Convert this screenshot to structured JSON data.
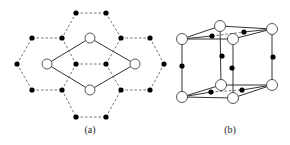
{
  "figure": {
    "panel_a": {
      "label": "(a)",
      "description": "Hexagonal lattice (top view) with rhombic unit cell",
      "open_atoms": [
        [
          90,
          38
        ],
        [
          47,
          64
        ],
        [
          135,
          64
        ],
        [
          90,
          90
        ]
      ],
      "filled_atoms": [
        [
          76,
          13
        ],
        [
          106,
          13
        ],
        [
          32,
          38
        ],
        [
          62,
          38
        ],
        [
          121,
          38
        ],
        [
          150,
          38
        ],
        [
          17,
          64
        ],
        [
          76,
          64
        ],
        [
          106,
          64
        ],
        [
          164,
          64
        ],
        [
          32,
          90
        ],
        [
          62,
          90
        ],
        [
          121,
          90
        ],
        [
          150,
          90
        ],
        [
          76,
          117
        ],
        [
          106,
          117
        ]
      ],
      "dashed_bonds": [
        [
          [
            76,
            13
          ],
          [
            106,
            13
          ]
        ],
        [
          [
            76,
            13
          ],
          [
            62,
            38
          ]
        ],
        [
          [
            106,
            13
          ],
          [
            121,
            38
          ]
        ],
        [
          [
            32,
            38
          ],
          [
            62,
            38
          ]
        ],
        [
          [
            121,
            38
          ],
          [
            150,
            38
          ]
        ],
        [
          [
            17,
            64
          ],
          [
            32,
            38
          ]
        ],
        [
          [
            17,
            64
          ],
          [
            32,
            90
          ]
        ],
        [
          [
            62,
            38
          ],
          [
            76,
            64
          ]
        ],
        [
          [
            76,
            64
          ],
          [
            106,
            64
          ]
        ],
        [
          [
            106,
            64
          ],
          [
            121,
            38
          ]
        ],
        [
          [
            150,
            38
          ],
          [
            164,
            64
          ]
        ],
        [
          [
            164,
            64
          ],
          [
            150,
            90
          ]
        ],
        [
          [
            76,
            64
          ],
          [
            62,
            90
          ]
        ],
        [
          [
            106,
            64
          ],
          [
            121,
            90
          ]
        ],
        [
          [
            32,
            90
          ],
          [
            62,
            90
          ]
        ],
        [
          [
            121,
            90
          ],
          [
            150,
            90
          ]
        ],
        [
          [
            62,
            90
          ],
          [
            76,
            117
          ]
        ],
        [
          [
            76,
            117
          ],
          [
            106,
            117
          ]
        ],
        [
          [
            106,
            117
          ],
          [
            121,
            90
          ]
        ]
      ],
      "solid_bonds": [
        [
          [
            47,
            64
          ],
          [
            90,
            38
          ]
        ],
        [
          [
            90,
            38
          ],
          [
            135,
            64
          ]
        ],
        [
          [
            135,
            64
          ],
          [
            90,
            90
          ]
        ],
        [
          [
            90,
            90
          ],
          [
            47,
            64
          ]
        ]
      ]
    },
    "panel_b": {
      "label": "(b)",
      "description": "3D hexagonal prism unit cell",
      "open_atoms": [
        [
          182,
          39
        ],
        [
          220,
          26
        ],
        [
          272,
          29
        ],
        [
          233,
          39
        ],
        [
          182,
          97
        ],
        [
          221,
          85
        ],
        [
          272,
          85
        ],
        [
          233,
          98
        ]
      ],
      "filled_atoms": [
        [
          212,
          36
        ],
        [
          244,
          32
        ],
        [
          211,
          92
        ],
        [
          242,
          90
        ],
        [
          182,
          66
        ],
        [
          222,
          56
        ],
        [
          232,
          68
        ],
        [
          273,
          57
        ]
      ],
      "solid_bonds": [
        [
          [
            182,
            39
          ],
          [
            220,
            26
          ]
        ],
        [
          [
            220,
            26
          ],
          [
            272,
            29
          ]
        ],
        [
          [
            182,
            39
          ],
          [
            233,
            39
          ]
        ],
        [
          [
            233,
            39
          ],
          [
            272,
            29
          ]
        ],
        [
          [
            182,
            39
          ],
          [
            212,
            36
          ]
        ],
        [
          [
            244,
            32
          ],
          [
            272,
            29
          ]
        ],
        [
          [
            182,
            97
          ],
          [
            221,
            85
          ]
        ],
        [
          [
            221,
            85
          ],
          [
            272,
            85
          ]
        ],
        [
          [
            182,
            97
          ],
          [
            233,
            98
          ]
        ],
        [
          [
            233,
            98
          ],
          [
            272,
            85
          ]
        ],
        [
          [
            182,
            97
          ],
          [
            211,
            92
          ]
        ],
        [
          [
            242,
            90
          ],
          [
            272,
            85
          ]
        ],
        [
          [
            182,
            39
          ],
          [
            182,
            97
          ]
        ],
        [
          [
            220,
            26
          ],
          [
            221,
            85
          ]
        ],
        [
          [
            233,
            39
          ],
          [
            233,
            98
          ]
        ],
        [
          [
            272,
            29
          ],
          [
            272,
            85
          ]
        ]
      ],
      "dashed_bonds": [
        [
          [
            212,
            36
          ],
          [
            244,
            32
          ]
        ],
        [
          [
            211,
            92
          ],
          [
            242,
            90
          ]
        ]
      ]
    },
    "colors": {
      "line": "#333333",
      "dashed": "#666666",
      "filled_atom": "#000000",
      "open_atom_fill": "#ffffff",
      "open_atom_stroke": "#444444"
    }
  }
}
